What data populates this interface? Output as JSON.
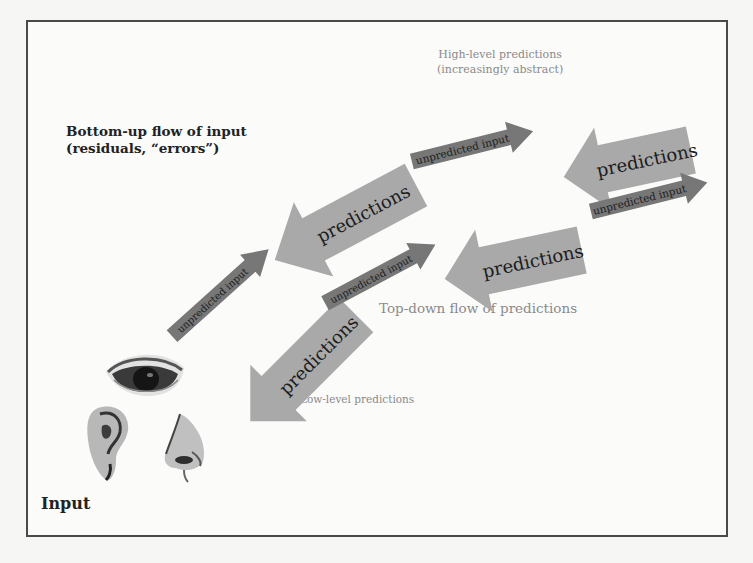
{
  "labels": {
    "bottom_up_line1": "Bottom-up flow of input",
    "bottom_up_line2": "(residuals, “errors”)",
    "high_level_line1": "High-level predictions",
    "high_level_line2": "(increasingly abstract)",
    "top_down": "Top-down flow of predictions",
    "low_level": "Low-level predictions",
    "input": "Input"
  },
  "arrows": {
    "predictions": [
      {
        "text": "predictions",
        "position": "low"
      },
      {
        "text": "predictions",
        "position": "mid-left"
      },
      {
        "text": "predictions",
        "position": "mid-right"
      },
      {
        "text": "predictions",
        "position": "high"
      }
    ],
    "unpredicted": [
      {
        "text": "unpredicted input",
        "position": "low"
      },
      {
        "text": "unpredicted input",
        "position": "mid-low"
      },
      {
        "text": "unpredicted input",
        "position": "mid-high"
      },
      {
        "text": "unpredicted input",
        "position": "high"
      }
    ]
  },
  "sense_icons": [
    "eye-icon",
    "ear-icon",
    "nose-icon"
  ],
  "colors": {
    "prediction_arrow": "#a9a9a9",
    "unpredicted_arrow": "#777777",
    "border": "#4a4a4a",
    "grey_text": "#8a8a8a",
    "bold_text": "#222222"
  }
}
